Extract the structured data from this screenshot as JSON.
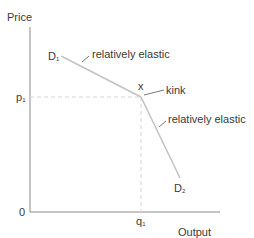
{
  "diagram": {
    "type": "kinked-demand-curve",
    "axes": {
      "y_label": "Price",
      "x_label": "Output",
      "origin_label": "0"
    },
    "points": {
      "price_level": {
        "label": "p",
        "subscript": "1"
      },
      "quantity_level": {
        "label": "q",
        "subscript": "1"
      },
      "kink_point": {
        "label": "x"
      }
    },
    "curves": {
      "upper": {
        "label": "D",
        "subscript": "1",
        "annotation": "relatively elastic"
      },
      "lower": {
        "label": "D",
        "subscript": "2",
        "annotation": "relatively elastic"
      }
    },
    "annotations": {
      "kink": "kink"
    },
    "colors": {
      "axis": "#888888",
      "curve": "#c8c8c8",
      "dashed": "#d4d4d4",
      "text": "#3a3a3a"
    }
  }
}
